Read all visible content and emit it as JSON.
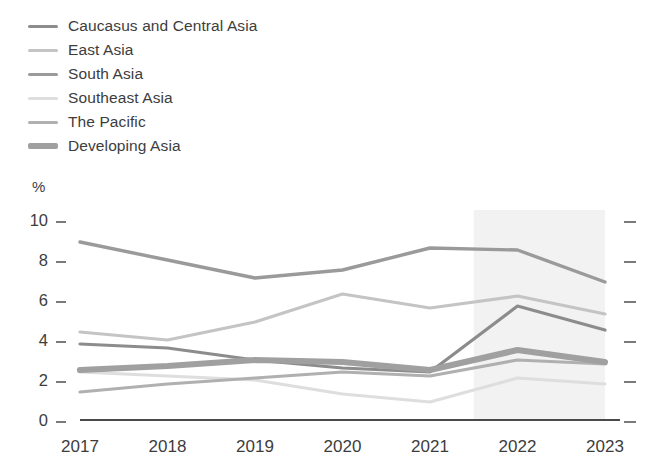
{
  "legend": {
    "items": [
      {
        "label": "Caucasus and Central Asia",
        "color": "#8c8c8c",
        "thick": false
      },
      {
        "label": "East Asia",
        "color": "#c4c4c4",
        "thick": false
      },
      {
        "label": "South Asia",
        "color": "#9a9a9a",
        "thick": false
      },
      {
        "label": "Southeast Asia",
        "color": "#dedede",
        "thick": false
      },
      {
        "label": "The Pacific",
        "color": "#b0b0b0",
        "thick": false
      },
      {
        "label": "Developing Asia",
        "color": "#a0a0a0",
        "thick": true
      }
    ]
  },
  "axis": {
    "unit_label": "%",
    "y_ticks": [
      "0",
      "2",
      "4",
      "6",
      "8",
      "10"
    ],
    "y_values": [
      0,
      2,
      4,
      6,
      8,
      10
    ],
    "x_labels": [
      "2017",
      "2018",
      "2019",
      "2020",
      "2021",
      "2022",
      "2023"
    ]
  },
  "forecast_band": {
    "start_year": "2021",
    "end_year": "2023",
    "color": "#f2f2f2"
  },
  "chart_data": {
    "type": "line",
    "title": "",
    "subtitle": "",
    "xlabel": "",
    "ylabel": "%",
    "ylim": [
      0,
      10
    ],
    "grid": false,
    "legend_position": "top-left",
    "categories": [
      "2017",
      "2018",
      "2019",
      "2020",
      "2021",
      "2022",
      "2023"
    ],
    "series": [
      {
        "name": "Caucasus and Central Asia",
        "color": "#8c8c8c",
        "width": 3.2,
        "values": [
          3.8,
          3.6,
          3.0,
          2.6,
          2.4,
          5.7,
          4.5
        ]
      },
      {
        "name": "East Asia",
        "color": "#c4c4c4",
        "width": 3.2,
        "values": [
          4.4,
          4.0,
          4.9,
          6.3,
          5.6,
          6.2,
          5.3
        ]
      },
      {
        "name": "South Asia",
        "color": "#9a9a9a",
        "width": 3.4,
        "values": [
          8.9,
          8.0,
          7.1,
          7.5,
          8.6,
          8.5,
          6.9
        ]
      },
      {
        "name": "Southeast Asia",
        "color": "#dedede",
        "width": 3.2,
        "values": [
          2.4,
          2.2,
          2.0,
          1.3,
          0.9,
          2.1,
          1.8
        ]
      },
      {
        "name": "The Pacific",
        "color": "#b0b0b0",
        "width": 3.2,
        "values": [
          1.4,
          1.8,
          2.1,
          2.4,
          2.2,
          3.0,
          2.8
        ]
      },
      {
        "name": "Developing Asia",
        "color": "#a0a0a0",
        "width": 6.2,
        "values": [
          2.5,
          2.7,
          3.0,
          2.9,
          2.5,
          3.5,
          2.9
        ]
      }
    ]
  }
}
